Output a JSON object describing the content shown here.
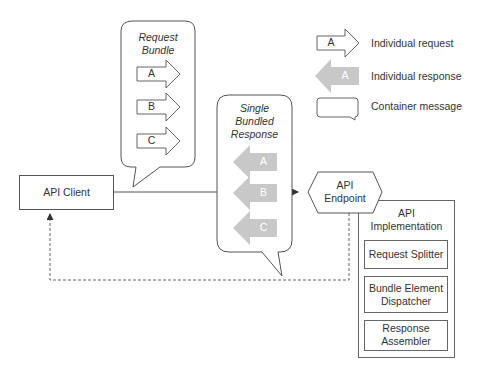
{
  "legend": {
    "items": [
      {
        "glyph_letter": "A",
        "label": "Individual request",
        "icon": "request-arrow-icon"
      },
      {
        "glyph_letter": "A",
        "label": "Individual response",
        "icon": "response-arrow-icon"
      },
      {
        "glyph_letter": "",
        "label": "Container message",
        "icon": "container-bubble-icon"
      }
    ]
  },
  "request_bundle": {
    "title_line1": "Request",
    "title_line2": "Bundle",
    "items": [
      "A",
      "B",
      "C"
    ]
  },
  "response_bundle": {
    "title_line1": "Single",
    "title_line2": "Bundled",
    "title_line3": "Response",
    "items": [
      "A",
      "B",
      "C"
    ]
  },
  "client": {
    "label": "API Client"
  },
  "endpoint": {
    "label_line1": "API",
    "label_line2": "Endpoint"
  },
  "implementation": {
    "title_line1": "API",
    "title_line2": "Implementation",
    "components": [
      {
        "line1": "Request Splitter",
        "line2": ""
      },
      {
        "line1": "Bundle Element",
        "line2": "Dispatcher"
      },
      {
        "line1": "Response",
        "line2": "Assembler"
      }
    ]
  },
  "colors": {
    "stroke": "#555555",
    "response_fill": "#c8c8c8",
    "text": "#333333"
  }
}
